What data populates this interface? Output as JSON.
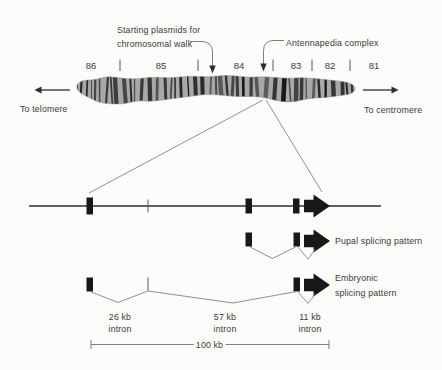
{
  "colors": {
    "background": "#fcfcfb",
    "ink": "#3a3a3a",
    "exon_fill": "#181818",
    "chromosome_base": "#a8a8a8",
    "band_color": "#141414"
  },
  "callouts": {
    "starting_plasmids": {
      "line1": "Starting plasmids for",
      "line2": "chromosomal walk"
    },
    "antennapedia": {
      "label": "Antennapedia complex"
    }
  },
  "chromosome": {
    "regions": [
      "86",
      "85",
      "84",
      "83",
      "82",
      "81"
    ],
    "left_direction": "To telomere",
    "right_direction": "To centromere"
  },
  "gene_map": {
    "pupal_pattern_label": "Pupal splicing pattern",
    "embryonic_pattern_line1": "Embryonic",
    "embryonic_pattern_line2": "splicing pattern",
    "introns": [
      {
        "size": "26 kb",
        "label": "intron"
      },
      {
        "size": "57 kb",
        "label": "intron"
      },
      {
        "size": "11 kb",
        "label": "intron"
      }
    ],
    "scale_label": "100 kb"
  }
}
